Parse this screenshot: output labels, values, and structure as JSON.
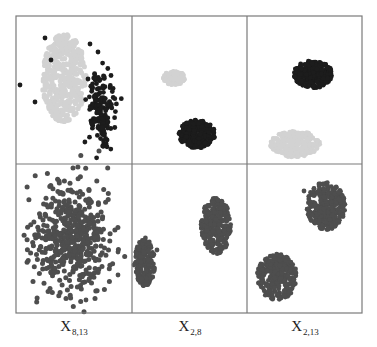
{
  "chart_data": {
    "type": "scatter",
    "title": "",
    "layout": {
      "rows": 2,
      "cols": 3,
      "grid": false,
      "legend": "none",
      "frame": {
        "x0": 16,
        "y0": 16,
        "x1": 362,
        "y1": 313,
        "col_splits": [
          132,
          247
        ],
        "row_split": 164
      }
    },
    "colors": {
      "light": "#d2d2d2",
      "dark": "#1c1c1c",
      "mid": "#4e4e4e",
      "frame": "#7a7a7a"
    },
    "columns": [
      {
        "label_main": "X",
        "label_sub": "8,13"
      },
      {
        "label_main": "X",
        "label_sub": "2,8"
      },
      {
        "label_main": "X",
        "label_sub": "2,13"
      }
    ],
    "panels": [
      {
        "row": 0,
        "col": 0,
        "clusters": [
          {
            "name": "light",
            "color": "light",
            "cx": 64,
            "cy": 78,
            "rx": 22,
            "ry": 44,
            "n": 420,
            "r": 2.6,
            "seed": 11
          },
          {
            "name": "dark",
            "color": "dark",
            "cx": 100,
            "cy": 108,
            "rx": 14,
            "ry": 38,
            "n": 170,
            "r": 2.4,
            "seed": 12,
            "scatter": true
          }
        ],
        "outliers": [
          [
            45,
            38,
            "dark"
          ],
          [
            51,
            60,
            "dark"
          ],
          [
            20,
            85,
            "dark"
          ],
          [
            35,
            102,
            "dark"
          ],
          [
            90,
            44,
            "dark"
          ],
          [
            98,
            52,
            "dark"
          ]
        ]
      },
      {
        "row": 0,
        "col": 1,
        "clusters": [
          {
            "name": "light",
            "color": "light",
            "cx": 174,
            "cy": 78,
            "rx": 11,
            "ry": 7,
            "n": 120,
            "r": 2.4,
            "seed": 21
          },
          {
            "name": "dark",
            "color": "dark",
            "cx": 197,
            "cy": 134,
            "rx": 18,
            "ry": 14,
            "n": 260,
            "r": 2.4,
            "seed": 22
          }
        ],
        "outliers": []
      },
      {
        "row": 0,
        "col": 2,
        "clusters": [
          {
            "name": "dark",
            "color": "dark",
            "cx": 313,
            "cy": 74,
            "rx": 19,
            "ry": 14,
            "n": 260,
            "r": 2.4,
            "seed": 31
          },
          {
            "name": "light",
            "color": "light",
            "cx": 295,
            "cy": 144,
            "rx": 25,
            "ry": 13,
            "n": 260,
            "r": 2.4,
            "seed": 32
          }
        ],
        "outliers": []
      },
      {
        "row": 1,
        "col": 0,
        "clusters": [
          {
            "name": "all",
            "color": "mid",
            "cx": 72,
            "cy": 238,
            "rx": 40,
            "ry": 58,
            "n": 520,
            "r": 2.5,
            "seed": 41,
            "scatter": true
          }
        ],
        "outliers": [
          [
            118,
            275,
            "mid"
          ],
          [
            86,
            300,
            "mid"
          ],
          [
            118,
            252,
            "mid"
          ]
        ]
      },
      {
        "row": 1,
        "col": 1,
        "clusters": [
          {
            "name": "right",
            "color": "mid",
            "cx": 216,
            "cy": 226,
            "rx": 15,
            "ry": 28,
            "n": 300,
            "r": 2.4,
            "seed": 51
          },
          {
            "name": "left",
            "color": "mid",
            "cx": 145,
            "cy": 262,
            "rx": 10,
            "ry": 24,
            "n": 200,
            "r": 2.4,
            "seed": 52
          }
        ],
        "outliers": [
          [
            134,
            265,
            "mid"
          ],
          [
            157,
            250,
            "mid"
          ]
        ]
      },
      {
        "row": 1,
        "col": 2,
        "clusters": [
          {
            "name": "top",
            "color": "mid",
            "cx": 326,
            "cy": 206,
            "rx": 19,
            "ry": 24,
            "n": 300,
            "r": 2.4,
            "seed": 61
          },
          {
            "name": "bottom",
            "color": "mid",
            "cx": 277,
            "cy": 277,
            "rx": 20,
            "ry": 23,
            "n": 300,
            "r": 2.4,
            "seed": 62
          }
        ],
        "outliers": [
          [
            304,
            191,
            "mid"
          ]
        ]
      }
    ]
  }
}
